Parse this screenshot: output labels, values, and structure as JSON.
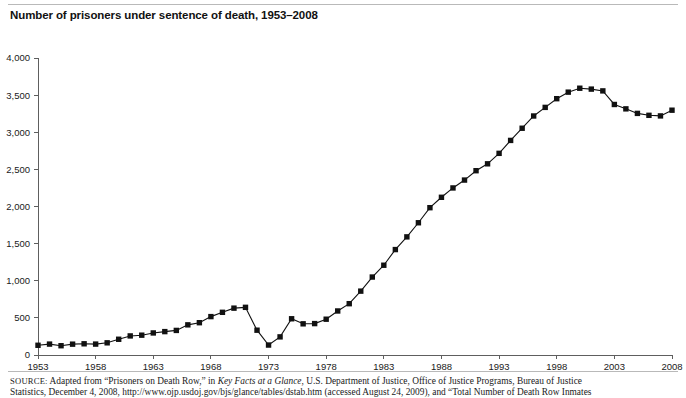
{
  "title": "Number of prisoners under sentence of death, 1953–2008",
  "source": {
    "label": "SOURCE:",
    "line1_part1": " Adapted from “Prisoners on Death Row,” in ",
    "line1_italic": "Key Facts at a Glance",
    "line1_part2": ", U.S. Department of Justice, Office of Justice Programs, Bureau of Justice",
    "line2": "Statistics, December 4, 2008, http://www.ojp.usdoj.gov/bjs/glance/tables/dstab.htm (accessed August 24, 2009), and “Total Number of Death Row Inmates"
  },
  "chart_data": {
    "type": "line",
    "title": "Number of prisoners under sentence of death, 1953–2008",
    "xlabel": "",
    "ylabel": "",
    "xlim": [
      1953,
      2008
    ],
    "ylim": [
      0,
      4000
    ],
    "grid": false,
    "legend": "none",
    "marker": "square",
    "series_color": "#111111",
    "yticks": [
      0,
      500,
      1000,
      1500,
      2000,
      2500,
      3000,
      3500,
      4000
    ],
    "ytick_labels": [
      "0",
      "500",
      "1,000",
      "1,500",
      "2,000",
      "2,500",
      "3,000",
      "3,500",
      "4,000"
    ],
    "xticks": [
      1953,
      1958,
      1963,
      1968,
      1973,
      1978,
      1983,
      1988,
      1993,
      1998,
      2003,
      2008
    ],
    "xtick_labels": [
      "1953",
      "1958",
      "1963",
      "1968",
      "1973",
      "1978",
      "1983",
      "1988",
      "1993",
      "1998",
      "2003",
      "2008"
    ],
    "x": [
      1953,
      1954,
      1955,
      1956,
      1957,
      1958,
      1959,
      1960,
      1961,
      1962,
      1963,
      1964,
      1965,
      1966,
      1967,
      1968,
      1969,
      1970,
      1971,
      1972,
      1973,
      1974,
      1975,
      1976,
      1977,
      1978,
      1979,
      1980,
      1981,
      1982,
      1983,
      1984,
      1985,
      1986,
      1987,
      1988,
      1989,
      1990,
      1991,
      1992,
      1993,
      1994,
      1995,
      1996,
      1997,
      1998,
      1999,
      2000,
      2001,
      2002,
      2003,
      2004,
      2005,
      2006,
      2007,
      2008
    ],
    "values": [
      131,
      147,
      125,
      146,
      151,
      147,
      164,
      212,
      257,
      267,
      297,
      315,
      331,
      406,
      435,
      517,
      575,
      631,
      642,
      334,
      134,
      244,
      488,
      420,
      423,
      482,
      593,
      691,
      860,
      1050,
      1209,
      1420,
      1591,
      1781,
      1984,
      2124,
      2250,
      2356,
      2482,
      2575,
      2716,
      2890,
      3054,
      3219,
      3335,
      3452,
      3540,
      3593,
      3581,
      3557,
      3374,
      3315,
      3254,
      3228,
      3220,
      3297
    ],
    "series": [
      {
        "name": "Prisoners under sentence of death",
        "values": [
          131,
          147,
          125,
          146,
          151,
          147,
          164,
          212,
          257,
          267,
          297,
          315,
          331,
          406,
          435,
          517,
          575,
          631,
          642,
          334,
          134,
          244,
          488,
          420,
          423,
          482,
          593,
          691,
          860,
          1050,
          1209,
          1420,
          1591,
          1781,
          1984,
          2124,
          2250,
          2356,
          2482,
          2575,
          2716,
          2890,
          3054,
          3219,
          3335,
          3452,
          3540,
          3593,
          3581,
          3557,
          3374,
          3315,
          3254,
          3228,
          3220,
          3297
        ]
      }
    ]
  }
}
